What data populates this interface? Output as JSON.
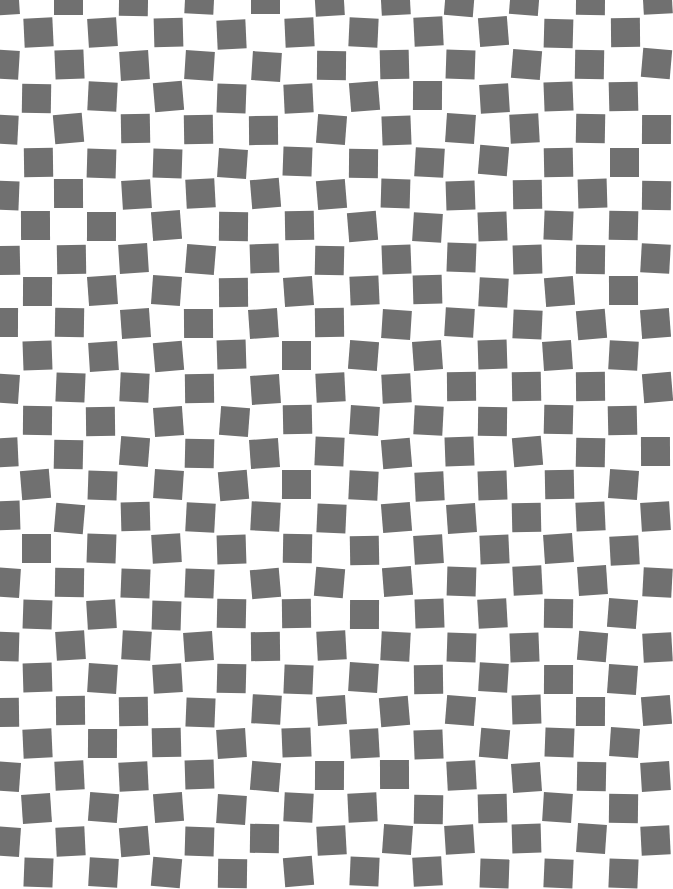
{
  "pattern": {
    "type": "distorted-checkerboard",
    "background_color": "#ffffff",
    "square_color": "#707070",
    "cell_width": 32.6,
    "cell_height": 32.3,
    "square_size": 29,
    "offset_x": -10,
    "offset_y": -14,
    "columns": 21,
    "rows": 28,
    "max_rotation_deg": 5
  }
}
